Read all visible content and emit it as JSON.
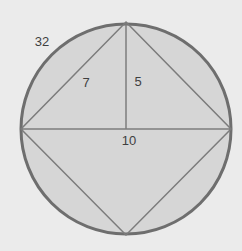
{
  "diagram": {
    "type": "circle with inscribed square and altitude",
    "colors": {
      "background": "#ebebeb",
      "circle_fill": "#d6d6d6",
      "circle_stroke": "#6e6e6e",
      "line_stroke": "#7c7c7c",
      "label_text": "#3f3f3f"
    },
    "circle": {
      "cx": 126,
      "cy": 129,
      "r": 105,
      "label": "32"
    },
    "vertices": {
      "top": [
        126,
        22
      ],
      "right": [
        231,
        129
      ],
      "bottom": [
        126,
        235
      ],
      "left": [
        21,
        129
      ]
    },
    "labels": {
      "circumference": {
        "text": "32",
        "x": 42,
        "y": 46
      },
      "side": {
        "text": "7",
        "x": 86,
        "y": 87
      },
      "height": {
        "text": "5",
        "x": 138,
        "y": 86
      },
      "diagonal": {
        "text": "10",
        "x": 129,
        "y": 145
      }
    }
  }
}
